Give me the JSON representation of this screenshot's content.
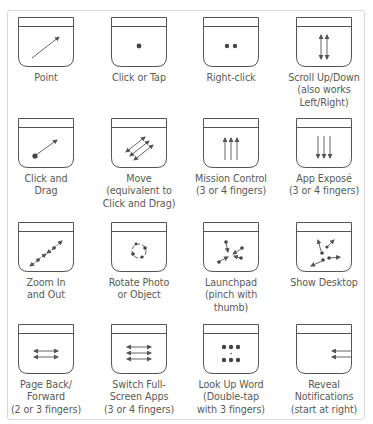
{
  "header": {
    "title_clipped": "Multi-Touch gestures for the Magic Trackpad"
  },
  "colors": {
    "stroke": "#555555",
    "panel_border": "#d9d9d9",
    "text": "#5a5a5a"
  },
  "gestures": [
    {
      "id": "point",
      "icon": "arrow-diagonal-icon",
      "lines": [
        "Point"
      ]
    },
    {
      "id": "click-or-tap",
      "icon": "single-dot-icon",
      "lines": [
        "Click or Tap"
      ]
    },
    {
      "id": "right-click",
      "icon": "two-dots-icon",
      "lines": [
        "Right-click"
      ]
    },
    {
      "id": "scroll",
      "icon": "two-vertical-double-arrows-icon",
      "lines": [
        "Scroll Up/Down",
        "(also works",
        "Left/Right)"
      ]
    },
    {
      "id": "click-and-drag",
      "icon": "dot-with-arrow-icon",
      "lines": [
        "Click and",
        "Drag"
      ]
    },
    {
      "id": "move",
      "icon": "three-diagonal-double-arrows-icon",
      "lines": [
        "Move",
        "(equivalent to",
        "Click and Drag)"
      ]
    },
    {
      "id": "mission-control",
      "icon": "three-up-arrows-icon",
      "lines": [
        "Mission Control",
        "(3 or 4 fingers)"
      ]
    },
    {
      "id": "app-expose",
      "icon": "three-down-arrows-icon",
      "lines": [
        "App Exposé",
        "(3 or 4 fingers)"
      ]
    },
    {
      "id": "zoom",
      "icon": "pinch-zoom-icon",
      "lines": [
        "Zoom In",
        "and Out"
      ]
    },
    {
      "id": "rotate",
      "icon": "rotate-circle-icon",
      "lines": [
        "Rotate Photo",
        "or Object"
      ]
    },
    {
      "id": "launchpad",
      "icon": "pinch-inward-icon",
      "lines": [
        "Launchpad",
        "(pinch with",
        "thumb)"
      ]
    },
    {
      "id": "show-desktop",
      "icon": "spread-outward-icon",
      "lines": [
        "Show Desktop"
      ]
    },
    {
      "id": "page-back-forward",
      "icon": "two-horizontal-double-arrows-icon",
      "lines": [
        "Page Back/",
        "Forward",
        "(2 or 3 fingers)"
      ]
    },
    {
      "id": "switch-full-screen-apps",
      "icon": "three-horizontal-double-arrows-icon",
      "lines": [
        "Switch Full-",
        "Screen Apps",
        "(3 or 4 fingers)"
      ]
    },
    {
      "id": "look-up-word",
      "icon": "six-dots-icon",
      "lines": [
        "Look Up Word",
        "(Double-tap",
        "with 3 fingers)"
      ]
    },
    {
      "id": "reveal-notifications",
      "icon": "left-arrows-from-edge-icon",
      "lines": [
        "Reveal",
        "Notifications",
        "(start at right)"
      ]
    }
  ]
}
